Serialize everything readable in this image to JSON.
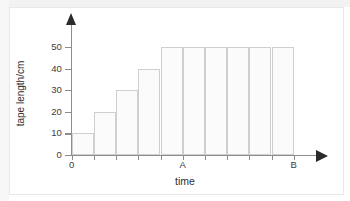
{
  "figure": {
    "background_color": "#ffffff",
    "frame_color": "#e8e8e8",
    "axis_color": "#8d8d8d",
    "arrow_color": "#2b2b2b",
    "bar_fill": "#fbfbfb",
    "bar_stroke": "#cfcfcf"
  },
  "chart_data": {
    "type": "bar",
    "title": "",
    "subtitle": "",
    "xlabel": "time",
    "ylabel": "tape length/cm",
    "categories": [
      "1",
      "2",
      "3",
      "4",
      "5",
      "6",
      "7",
      "8",
      "9",
      "10"
    ],
    "values": [
      10,
      20,
      30,
      40,
      50,
      50,
      50,
      50,
      50,
      50
    ],
    "ylim": [
      0,
      57
    ],
    "yticks": [
      0,
      10,
      20,
      30,
      40,
      50
    ],
    "ytick_labels": [
      "0",
      "10",
      "20",
      "30",
      "40",
      "50"
    ],
    "xtick_labels": [
      "0",
      "A",
      "B"
    ],
    "xtick_marked": [
      {
        "label": "0",
        "category_index": 0
      },
      {
        "label": "A",
        "category_index": 5
      },
      {
        "label": "B",
        "category_index": 10
      }
    ],
    "grid": false,
    "legend": null,
    "annotations": [],
    "axis_arrows": true,
    "bar_gap": 0
  },
  "axes": {
    "y_title": "tape length/cm",
    "x_title": "time",
    "origin_label": "0"
  }
}
